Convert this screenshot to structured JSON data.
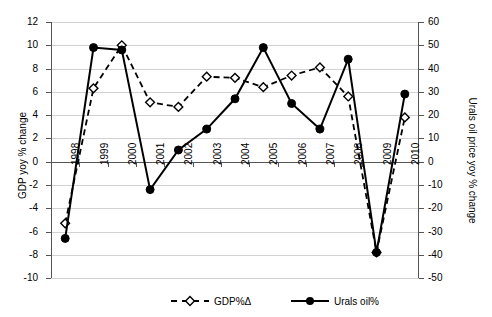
{
  "chart_data": {
    "type": "line",
    "title": "",
    "xlabel": "",
    "ylabel": "GDP yoy % change",
    "y2label": "Urals oil price yoy % change",
    "categories": [
      "1998",
      "1999",
      "2000",
      "2001",
      "2002",
      "2003",
      "2004",
      "2005",
      "2006",
      "2007",
      "2008",
      "2009",
      "2010"
    ],
    "ylim": [
      -10,
      12
    ],
    "y2lim": [
      -50,
      60
    ],
    "yticks": [
      "12",
      "10",
      "8",
      "6",
      "4",
      "2",
      "0",
      "-2",
      "-4",
      "-6",
      "-8",
      "-10"
    ],
    "y2ticks": [
      "60",
      "50",
      "40",
      "30",
      "20",
      "10",
      "0",
      "-10",
      "-20",
      "-30",
      "-40",
      "-50"
    ],
    "grid": true,
    "legend_position": "bottom",
    "series": [
      {
        "name": "GDP%Δ",
        "axis": "left",
        "style": "dashed",
        "marker": "open-diamond",
        "values": [
          -5.3,
          6.3,
          10.0,
          5.1,
          4.7,
          7.3,
          7.2,
          6.4,
          7.4,
          8.1,
          5.6,
          -7.8,
          3.8
        ]
      },
      {
        "name": "Urals oil%",
        "axis": "right",
        "style": "solid",
        "marker": "filled-circle",
        "values": [
          -33,
          49,
          48,
          -12,
          5,
          14,
          27,
          49,
          25,
          14,
          44,
          -39,
          29
        ]
      }
    ]
  },
  "legend": {
    "items": [
      {
        "label": "GDP%Δ"
      },
      {
        "label": "Urals oil%"
      }
    ]
  },
  "colors": {
    "series_line": "#000000",
    "grid": "#d2d2d2",
    "axis": "#555555",
    "background": "#ffffff"
  }
}
